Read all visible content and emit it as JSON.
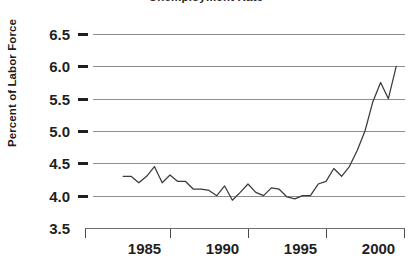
{
  "chart_data": {
    "type": "line",
    "title": "Unemployment Rate",
    "xlabel": "",
    "ylabel": "Percent of Labor Force",
    "ylim": [
      3.5,
      6.5
    ],
    "xlim": [
      1982.0,
      1999.5
    ],
    "grid": true,
    "legend": "none",
    "ytick_labels": [
      "6.5",
      "6.0",
      "5.5",
      "5.0",
      "4.5",
      "4.0",
      "3.5"
    ],
    "ytick_values": [
      6.5,
      6.0,
      5.5,
      5.0,
      4.5,
      4.0,
      3.5
    ],
    "xtick_labels": [
      "1985",
      "1990",
      "1995",
      "2000"
    ],
    "xtick_values": [
      1985,
      1990,
      1995,
      2000
    ],
    "series": [
      {
        "name": "Percent of Labor Force",
        "color": "#3a3a3a",
        "x": [
          1982.0,
          1982.5,
          1983.0,
          1983.5,
          1984.0,
          1984.5,
          1985.0,
          1985.5,
          1986.0,
          1986.5,
          1987.0,
          1987.5,
          1988.0,
          1988.5,
          1989.0,
          1989.5,
          1990.0,
          1990.5,
          1991.0,
          1991.5,
          1992.0,
          1992.5,
          1993.0,
          1993.5,
          1994.0,
          1994.5,
          1995.0,
          1995.5,
          1996.0,
          1996.5,
          1997.0,
          1997.5,
          1998.0,
          1998.5,
          1999.0
        ],
        "values": [
          4.3,
          4.3,
          4.2,
          4.3,
          4.45,
          4.2,
          4.32,
          4.22,
          4.22,
          4.1,
          4.1,
          4.08,
          4.0,
          4.15,
          3.93,
          4.05,
          4.18,
          4.05,
          4.0,
          4.12,
          4.1,
          3.98,
          3.95,
          4.0,
          4.0,
          4.18,
          4.22,
          4.42,
          4.3,
          4.45,
          4.7,
          5.0,
          5.45,
          5.75,
          5.5
        ],
        "endpoint": {
          "x": 1999.5,
          "value": 6.0
        }
      }
    ],
    "annotations": []
  }
}
